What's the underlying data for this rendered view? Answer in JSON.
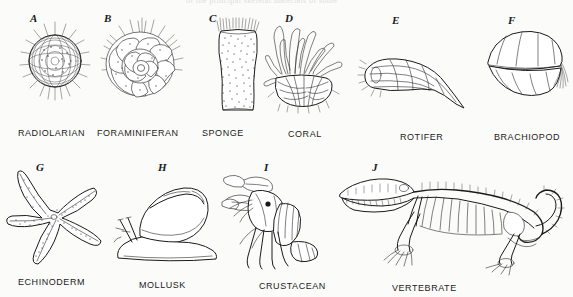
{
  "plate": {
    "cropped_header_text": "of the principal skeletal materials of some",
    "background_color": "#fbfbf9",
    "ink_color": "#1a1a1a"
  },
  "figures": [
    {
      "letter": "A",
      "caption": "RADIOLARIAN",
      "icon": "radiolarian-sphere-icon",
      "letter_x": 30,
      "letter_y": 12,
      "art_x": 18,
      "art_y": 20,
      "art_w": 74,
      "art_h": 92,
      "caption_x": 18,
      "caption_y": 128
    },
    {
      "letter": "B",
      "caption": "FORAMINIFERAN",
      "icon": "foraminiferan-spiral-icon",
      "letter_x": 104,
      "letter_y": 12,
      "art_x": 96,
      "art_y": 18,
      "art_w": 92,
      "art_h": 96,
      "caption_x": 97,
      "caption_y": 128
    },
    {
      "letter": "C",
      "caption": "SPONGE",
      "icon": "sponge-vase-icon",
      "letter_x": 209,
      "letter_y": 12,
      "art_x": 214,
      "art_y": 18,
      "art_w": 48,
      "art_h": 96,
      "caption_x": 202,
      "caption_y": 128
    },
    {
      "letter": "D",
      "caption": "CORAL",
      "icon": "coral-polyp-icon",
      "letter_x": 285,
      "letter_y": 12,
      "art_x": 262,
      "art_y": 18,
      "art_w": 84,
      "art_h": 96,
      "caption_x": 288,
      "caption_y": 129
    },
    {
      "letter": "E",
      "caption": "ROTIFER",
      "icon": "rotifer-icon",
      "letter_x": 392,
      "letter_y": 14,
      "art_x": 360,
      "art_y": 48,
      "art_w": 114,
      "art_h": 62,
      "caption_x": 400,
      "caption_y": 132
    },
    {
      "letter": "F",
      "caption": "BRACHIOPOD",
      "icon": "brachiopod-shell-icon",
      "letter_x": 508,
      "letter_y": 14,
      "art_x": 482,
      "art_y": 26,
      "art_w": 88,
      "art_h": 78,
      "caption_x": 494,
      "caption_y": 132
    },
    {
      "letter": "G",
      "caption": "ECHINODERM",
      "icon": "echinoderm-starfish-icon",
      "letter_x": 36,
      "letter_y": 161,
      "art_x": 6,
      "art_y": 166,
      "art_w": 104,
      "art_h": 106,
      "caption_x": 18,
      "caption_y": 277
    },
    {
      "letter": "H",
      "caption": "MOLLUSK",
      "icon": "mollusk-snail-icon",
      "letter_x": 158,
      "letter_y": 161,
      "art_x": 112,
      "art_y": 180,
      "art_w": 116,
      "art_h": 86,
      "caption_x": 139,
      "caption_y": 280
    },
    {
      "letter": "I",
      "caption": "CRUSTACEAN",
      "icon": "crustacean-crayfish-icon",
      "letter_x": 264,
      "letter_y": 161,
      "art_x": 222,
      "art_y": 172,
      "art_w": 110,
      "art_h": 98,
      "caption_x": 259,
      "caption_y": 281
    },
    {
      "letter": "J",
      "caption": "VERTEBRATE",
      "icon": "vertebrate-skeleton-icon",
      "letter_x": 372,
      "letter_y": 161,
      "art_x": 330,
      "art_y": 168,
      "art_w": 236,
      "art_h": 100,
      "caption_x": 392,
      "caption_y": 283
    }
  ]
}
